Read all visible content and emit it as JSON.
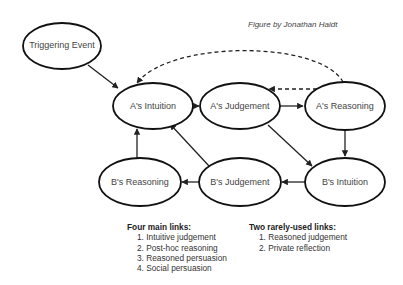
{
  "credit": "Figure by Jonathan Haidt",
  "nodes": {
    "trigger": "Triggering Event",
    "a_intuition": "A's Intuition",
    "a_judgement": "A's Judgement",
    "a_reasoning": "A's Reasoning",
    "b_reasoning": "B's Reasoning",
    "b_judgement": "B's Judgement",
    "b_intuition": "B's Intuition"
  },
  "edges": [
    {
      "from": "Triggering Event",
      "to": "A's Intuition",
      "style": "solid"
    },
    {
      "from": "A's Intuition",
      "to": "A's Judgement",
      "style": "solid"
    },
    {
      "from": "A's Judgement",
      "to": "A's Reasoning",
      "style": "solid"
    },
    {
      "from": "A's Reasoning",
      "to": "A's Judgement",
      "style": "dashed"
    },
    {
      "from": "A's Reasoning",
      "to": "A's Intuition",
      "style": "dashed"
    },
    {
      "from": "A's Reasoning",
      "to": "B's Intuition",
      "style": "solid"
    },
    {
      "from": "A's Judgement",
      "to": "B's Intuition",
      "style": "solid"
    },
    {
      "from": "B's Intuition",
      "to": "B's Judgement",
      "style": "solid"
    },
    {
      "from": "B's Judgement",
      "to": "B's Reasoning",
      "style": "solid"
    },
    {
      "from": "B's Judgement",
      "to": "A's Intuition",
      "style": "solid"
    },
    {
      "from": "B's Reasoning",
      "to": "A's Intuition",
      "style": "solid"
    }
  ],
  "legend": {
    "main": {
      "title": "Four main links:",
      "items": [
        "1. Intuitive judgement",
        "2. Post-hoc reasoning",
        "3. Reasoned persuasion",
        "4. Social persuasion"
      ]
    },
    "rare": {
      "title": "Two rarely-used links:",
      "items": [
        "1. Reasoned judgement",
        "2. Private reflection"
      ]
    }
  }
}
